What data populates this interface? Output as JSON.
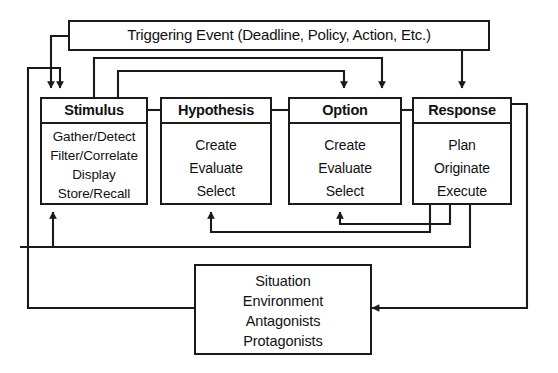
{
  "diagram": {
    "title_box": {
      "label": "Triggering Event (Deadline, Policy, Action, Etc.)"
    },
    "stages": [
      {
        "id": "stimulus",
        "header": "Stimulus",
        "items": [
          "Gather/Detect",
          "Filter/Correlate",
          "Display",
          "Store/Recall"
        ]
      },
      {
        "id": "hypothesis",
        "header": "Hypothesis",
        "items": [
          "Create",
          "Evaluate",
          "Select"
        ]
      },
      {
        "id": "option",
        "header": "Option",
        "items": [
          "Create",
          "Evaluate",
          "Select"
        ]
      },
      {
        "id": "response",
        "header": "Response",
        "items": [
          "Plan",
          "Originate",
          "Execute"
        ]
      }
    ],
    "context_box": {
      "items": [
        "Situation",
        "Environment",
        "Antagonists",
        "Protagonists"
      ]
    },
    "colors": {
      "line": "#1a1a1a",
      "background": "#ffffff",
      "text": "#111111"
    }
  }
}
